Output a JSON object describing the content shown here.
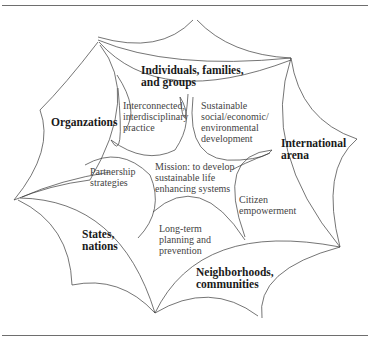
{
  "figure": {
    "type": "web-of-systems diagram",
    "outer_domains": [
      {
        "id": "individuals",
        "label": "Individuals, families,\nand groups"
      },
      {
        "id": "organizations",
        "label": "Organzations"
      },
      {
        "id": "international",
        "label": "International\narena"
      },
      {
        "id": "states",
        "label": "States,\nnations"
      },
      {
        "id": "neighborhoods",
        "label": "Neighborhoods,\ncommunities"
      }
    ],
    "inner_concepts": [
      {
        "id": "interconnected",
        "label": "Interconnected,\ninterdisciplinary\npractice"
      },
      {
        "id": "sustainable",
        "label": "Sustainable\nsocial/economic/\nenvironmental\ndevelopment"
      },
      {
        "id": "mission",
        "label": "Mission: to develop\nsustainable life\nenhancing systems"
      },
      {
        "id": "partnership",
        "label": "Partnership\nstrategies"
      },
      {
        "id": "citizen",
        "label": "Citizen\nempowerment"
      },
      {
        "id": "longterm",
        "label": "Long-term\nplanning and\nprevention"
      }
    ],
    "colors": {
      "stroke": "#3a3a3a",
      "rule": "#6e6e6e",
      "background": "#ffffff"
    }
  }
}
